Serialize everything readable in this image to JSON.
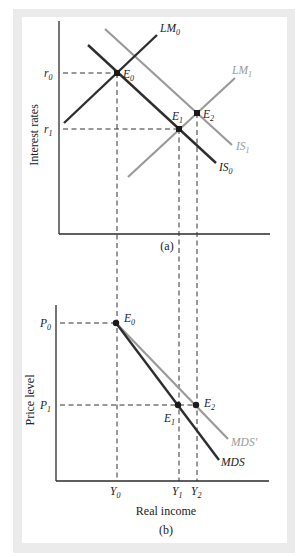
{
  "figure": {
    "panel_a": {
      "caption": "(a)",
      "y_axis_label": "Interest rates",
      "y_ticks": [
        {
          "base": "r",
          "sub": "0"
        },
        {
          "base": "r",
          "sub": "1"
        }
      ],
      "curves": [
        {
          "name": "LM",
          "sub": "0",
          "shade": "dark"
        },
        {
          "name": "LM",
          "sub": "1",
          "shade": "light"
        },
        {
          "name": "IS",
          "sub": "0",
          "shade": "dark"
        },
        {
          "name": "IS",
          "sub": "1",
          "shade": "light"
        }
      ],
      "points": [
        {
          "base": "E",
          "sub": "0"
        },
        {
          "base": "E",
          "sub": "1"
        },
        {
          "base": "E",
          "sub": "2"
        }
      ]
    },
    "panel_b": {
      "caption": "(b)",
      "y_axis_label": "Price level",
      "x_axis_label": "Real income",
      "y_ticks": [
        {
          "base": "P",
          "sub": "0"
        },
        {
          "base": "P",
          "sub": "1"
        }
      ],
      "x_ticks": [
        {
          "base": "Y",
          "sub": "0"
        },
        {
          "base": "Y",
          "sub": "1"
        },
        {
          "base": "Y",
          "sub": "2"
        }
      ],
      "curves": [
        {
          "name": "MDS",
          "shade": "dark"
        },
        {
          "name": "MDS'",
          "shade": "light"
        }
      ],
      "points": [
        {
          "base": "E",
          "sub": "0"
        },
        {
          "base": "E",
          "sub": "1"
        },
        {
          "base": "E",
          "sub": "2"
        }
      ]
    },
    "colors": {
      "dark_curve": "#2e2e2e",
      "light_curve": "#9a9a9a",
      "frame": "#ebebeb"
    }
  }
}
